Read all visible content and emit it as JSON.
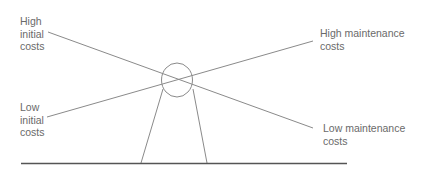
{
  "diagram": {
    "labels": {
      "high_initial": "High\ninitial\ncosts",
      "low_initial": "Low\ninitial\ncosts",
      "high_maintenance": "High maintenance\ncosts",
      "low_maintenance": "Low maintenance\ncosts"
    },
    "colors": {
      "line": "#8a8a8a",
      "baseline": "#555555",
      "text": "#6a6a6a"
    }
  }
}
